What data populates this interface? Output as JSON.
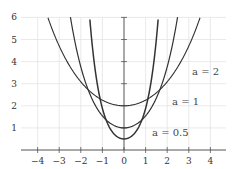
{
  "chart_data": {
    "type": "line",
    "title": "",
    "xlabel": "",
    "ylabel": "",
    "xlim": [
      -4.5,
      4.7
    ],
    "ylim": [
      0,
      6
    ],
    "grid": true,
    "x_ticks": [
      -4,
      -3,
      -2,
      -1,
      0,
      1,
      2,
      3,
      4
    ],
    "y_ticks": [
      1,
      2,
      3,
      4,
      5,
      6
    ],
    "function": "y = a*cosh(x/a)",
    "series": [
      {
        "name": "a=2",
        "a": 2,
        "label": "a = 2",
        "label_pos": [
          3.5,
          3.6
        ],
        "x": [
          -3.5,
          -3,
          -2,
          -1,
          0,
          1,
          2,
          3,
          3.5
        ],
        "values": [
          5.85,
          4.7,
          3.09,
          2.26,
          2.0,
          2.26,
          3.09,
          4.7,
          5.85
        ]
      },
      {
        "name": "a=1",
        "a": 1,
        "label": "a = 1",
        "label_pos": [
          2.5,
          2.2
        ],
        "x": [
          -2.48,
          -2,
          -1,
          0,
          1,
          2,
          2.48
        ],
        "values": [
          6.0,
          3.76,
          1.54,
          1.0,
          1.54,
          3.76,
          6.0
        ]
      },
      {
        "name": "a=0.5",
        "a": 0.5,
        "label": "a = 0.5",
        "label_pos": [
          1.6,
          0.8
        ],
        "x": [
          -1.59,
          -1,
          -0.5,
          0,
          0.5,
          1,
          1.59
        ],
        "values": [
          6.0,
          1.88,
          0.77,
          0.5,
          0.77,
          1.88,
          6.0
        ]
      }
    ]
  },
  "labels": {
    "x_ticks": [
      "−4",
      "−3",
      "−2",
      "−1",
      "0",
      "1",
      "2",
      "3",
      "4"
    ],
    "y_ticks": [
      "1",
      "2",
      "3",
      "4",
      "5",
      "6"
    ],
    "curve_a2": "a = 2",
    "curve_a1": "a = 1",
    "curve_a05": "a = 0.5"
  }
}
